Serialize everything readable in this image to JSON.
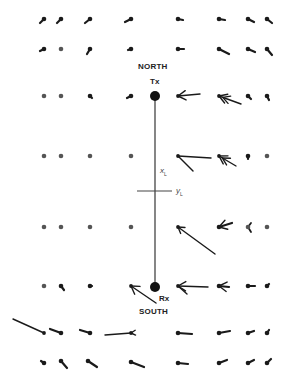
{
  "diagram": {
    "labels": {
      "north": "NORTH",
      "south": "SOUTH",
      "tx": "Tx",
      "rx": "Rx",
      "x_axis": "x",
      "x_sub": "L",
      "y_axis": "y",
      "y_sub": "L"
    },
    "colors": {
      "ink": "#1a1a1a",
      "line": "#444444",
      "dot": "#555555"
    },
    "tx": {
      "x": 155,
      "y": 96
    },
    "rx": {
      "x": 155,
      "y": 287
    },
    "crossbar": {
      "x1": 137,
      "x2": 172,
      "y": 191
    },
    "grid_columns": [
      44,
      61,
      90,
      131,
      178,
      219,
      248,
      267
    ],
    "grid_rows": [
      19,
      49,
      96,
      156,
      227,
      286,
      333,
      363
    ],
    "vectors": [
      {
        "row": 0,
        "col": 0,
        "dx": -4,
        "dy": 4
      },
      {
        "row": 0,
        "col": 1,
        "dx": -4,
        "dy": 4
      },
      {
        "row": 0,
        "col": 2,
        "dx": -5,
        "dy": 4
      },
      {
        "row": 0,
        "col": 3,
        "dx": -6,
        "dy": 3
      },
      {
        "row": 0,
        "col": 4,
        "dx": 5,
        "dy": 1
      },
      {
        "row": 0,
        "col": 5,
        "dx": 6,
        "dy": 1
      },
      {
        "row": 0,
        "col": 6,
        "dx": 6,
        "dy": 3
      },
      {
        "row": 0,
        "col": 7,
        "dx": 5,
        "dy": 4
      },
      {
        "row": 1,
        "col": 0,
        "dx": -4,
        "dy": 2
      },
      {
        "row": 1,
        "col": 1,
        "dx": 0,
        "dy": 0
      },
      {
        "row": 1,
        "col": 2,
        "dx": -3,
        "dy": 5
      },
      {
        "row": 1,
        "col": 3,
        "dx": -3,
        "dy": 1
      },
      {
        "row": 1,
        "col": 4,
        "dx": 6,
        "dy": 0
      },
      {
        "row": 1,
        "col": 5,
        "dx": 10,
        "dy": 5
      },
      {
        "row": 1,
        "col": 6,
        "dx": 7,
        "dy": 3
      },
      {
        "row": 1,
        "col": 7,
        "dx": 5,
        "dy": 6
      },
      {
        "row": 2,
        "col": 0,
        "dx": 0,
        "dy": 0
      },
      {
        "row": 2,
        "col": 1,
        "dx": 0,
        "dy": 0
      },
      {
        "row": 2,
        "col": 2,
        "dx": 2,
        "dy": 2
      },
      {
        "row": 2,
        "col": 3,
        "dx": -4,
        "dy": 2
      },
      {
        "row": 2,
        "col": 4,
        "dx": 22,
        "dy": -2,
        "head": true
      },
      {
        "row": 2,
        "col": 5,
        "dx": 22,
        "dy": 8,
        "head": true,
        "double": true
      },
      {
        "row": 2,
        "col": 6,
        "dx": 3,
        "dy": 3
      },
      {
        "row": 2,
        "col": 7,
        "dx": 2,
        "dy": 4
      },
      {
        "row": 3,
        "col": 0,
        "dx": 0,
        "dy": 0
      },
      {
        "row": 3,
        "col": 1,
        "dx": 0,
        "dy": 0
      },
      {
        "row": 3,
        "col": 2,
        "dx": 0,
        "dy": 0
      },
      {
        "row": 3,
        "col": 3,
        "dx": 0,
        "dy": 0
      },
      {
        "row": 3,
        "col": 4,
        "dx": 33,
        "dy": 2,
        "head": false,
        "branch": {
          "dx": 15,
          "dy": 15
        }
      },
      {
        "row": 3,
        "col": 5,
        "dx": 17,
        "dy": 10,
        "head": true,
        "double": true
      },
      {
        "row": 3,
        "col": 6,
        "dx": 0,
        "dy": 3
      },
      {
        "row": 3,
        "col": 7,
        "dx": 0,
        "dy": 0
      },
      {
        "row": 4,
        "col": 0,
        "dx": 0,
        "dy": 0
      },
      {
        "row": 4,
        "col": 1,
        "dx": 0,
        "dy": 0
      },
      {
        "row": 4,
        "col": 2,
        "dx": 0,
        "dy": 0
      },
      {
        "row": 4,
        "col": 3,
        "dx": 0,
        "dy": 0
      },
      {
        "row": 4,
        "col": 4,
        "dx": 37,
        "dy": 27,
        "head": true,
        "small_head": true
      },
      {
        "row": 4,
        "col": 5,
        "dx": 13,
        "dy": -4,
        "head": true
      },
      {
        "row": 4,
        "col": 6,
        "dx": 0,
        "dy": 0,
        "chevron": true
      },
      {
        "row": 4,
        "col": 7,
        "dx": 0,
        "dy": 0
      },
      {
        "row": 5,
        "col": 0,
        "dx": 0,
        "dy": 0
      },
      {
        "row": 5,
        "col": 1,
        "dx": 3,
        "dy": 4
      },
      {
        "row": 5,
        "col": 2,
        "dx": 2,
        "dy": 0
      },
      {
        "row": 5,
        "col": 3,
        "dx": 25,
        "dy": 17,
        "head": true,
        "reverse": true
      },
      {
        "row": 5,
        "col": 4,
        "dx": 30,
        "dy": 1,
        "head": true,
        "branch": {
          "dx": 9,
          "dy": 8
        }
      },
      {
        "row": 5,
        "col": 5,
        "dx": 10,
        "dy": 1,
        "head": true
      },
      {
        "row": 5,
        "col": 6,
        "dx": 7,
        "dy": 0
      },
      {
        "row": 5,
        "col": 7,
        "dx": 2,
        "dy": -2
      },
      {
        "row": 6,
        "col": 0,
        "dx": -31,
        "dy": -14
      },
      {
        "row": 6,
        "col": 1,
        "dx": -11,
        "dy": -4
      },
      {
        "row": 6,
        "col": 2,
        "dx": -10,
        "dy": -3
      },
      {
        "row": 6,
        "col": 3,
        "dx": -26,
        "dy": 2,
        "tail_head": true
      },
      {
        "row": 6,
        "col": 4,
        "dx": 14,
        "dy": 1
      },
      {
        "row": 6,
        "col": 5,
        "dx": 11,
        "dy": -2
      },
      {
        "row": 6,
        "col": 6,
        "dx": 6,
        "dy": -2
      },
      {
        "row": 6,
        "col": 7,
        "dx": 2,
        "dy": -3
      },
      {
        "row": 7,
        "col": 0,
        "dx": -3,
        "dy": -2
      },
      {
        "row": 7,
        "col": 1,
        "dx": 6,
        "dy": 7,
        "from_offset": {
          "dx": 0,
          "dy": -2
        }
      },
      {
        "row": 7,
        "col": 2,
        "dx": 9,
        "dy": 6,
        "from_offset": {
          "dx": -2,
          "dy": -2
        }
      },
      {
        "row": 7,
        "col": 3,
        "dx": 13,
        "dy": 5,
        "from_offset": {
          "dx": 0,
          "dy": -1
        }
      },
      {
        "row": 7,
        "col": 4,
        "dx": 10,
        "dy": 1
      },
      {
        "row": 7,
        "col": 5,
        "dx": 8,
        "dy": -3
      },
      {
        "row": 7,
        "col": 6,
        "dx": 6,
        "dy": -3
      },
      {
        "row": 7,
        "col": 7,
        "dx": 4,
        "dy": -4
      }
    ]
  }
}
